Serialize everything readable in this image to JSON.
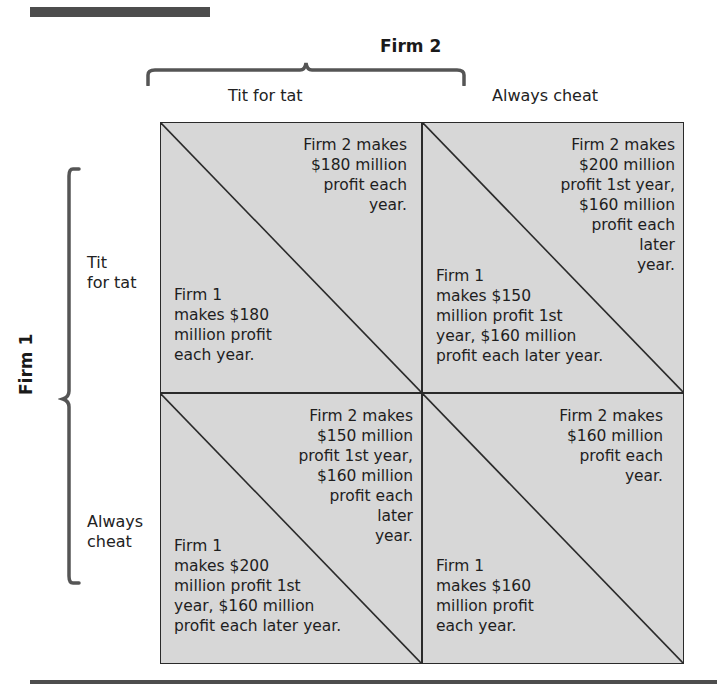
{
  "header": {
    "column_player": "Firm 2",
    "row_player": "Firm 1"
  },
  "columns": [
    {
      "label": "Tit for tat"
    },
    {
      "label": "Always cheat"
    }
  ],
  "rows": [
    {
      "label": "Tit\nfor tat"
    },
    {
      "label": "Always\ncheat"
    }
  ],
  "cells": [
    {
      "row": "Tit for tat",
      "col": "Tit for tat",
      "firm2": "Firm 2 makes\n$180 million\nprofit each\nyear.",
      "firm1": "Firm 1\nmakes $180\nmillion profit\neach year."
    },
    {
      "row": "Tit for tat",
      "col": "Always cheat",
      "firm2": "Firm 2 makes\n$200 million\nprofit 1st year,\n$160 million\nprofit each\nlater\nyear.",
      "firm1": "Firm 1\nmakes $150\nmillion profit 1st\nyear, $160 million\nprofit each later year."
    },
    {
      "row": "Always cheat",
      "col": "Tit for tat",
      "firm2": "Firm 2 makes\n$150 million\nprofit 1st year,\n$160 million\nprofit each\nlater\nyear.",
      "firm1": "Firm 1\nmakes $200\nmillion profit 1st\nyear, $160 million\nprofit each later year."
    },
    {
      "row": "Always cheat",
      "col": "Always cheat",
      "firm2": "Firm 2 makes\n$160 million\nprofit each\nyear.",
      "firm1": "Firm 1\nmakes $160\nmillion profit\neach year."
    }
  ],
  "colors": {
    "cell_fill": "#d7d7d7",
    "lines": "#2a2a2a",
    "brace": "#555555",
    "rule": "#4d4d4d"
  }
}
